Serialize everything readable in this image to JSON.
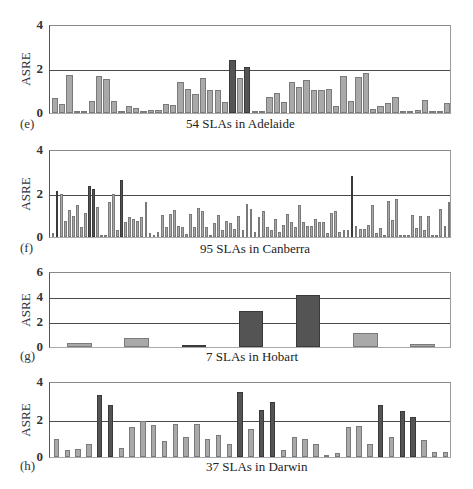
{
  "figure": {
    "y_axis_label": "ASRE"
  },
  "panels": [
    {
      "id": "e",
      "label": "(e)",
      "caption": "54 SLAs in Adelaide",
      "ymax": 4,
      "ticks": [
        "0",
        "2",
        "4"
      ],
      "gridlines": [
        2
      ]
    },
    {
      "id": "f",
      "label": "(f)",
      "caption": "95 SLAs in Canberra",
      "ymax": 4,
      "ticks": [
        "0",
        "2",
        "4"
      ],
      "gridlines": [
        2
      ]
    },
    {
      "id": "g",
      "label": "(g)",
      "caption": "7 SLAs in Hobart",
      "ymax": 6,
      "ticks": [
        "0",
        "2",
        "4",
        "6"
      ],
      "gridlines": [
        2,
        4
      ]
    },
    {
      "id": "h",
      "label": "(h)",
      "caption": "37 SLAs in Darwin",
      "ymax": 4,
      "ticks": [
        "0",
        "2",
        "4"
      ],
      "gridlines": [
        2
      ]
    }
  ],
  "colors": {
    "light_bar": "#a9a9a9",
    "dark_bar": "#545454",
    "gridline": "#4a4a4a"
  },
  "chart_data": [
    {
      "type": "bar",
      "title": "54 SLAs in Adelaide",
      "panel": "(e)",
      "xlabel": "54 SLAs in Adelaide",
      "ylabel": "ASRE",
      "ylim": [
        0,
        4
      ],
      "yticks": [
        0,
        2,
        4
      ],
      "grid": "horizontal at 2",
      "values": [
        0.7,
        0.4,
        1.75,
        0.02,
        0.02,
        0.55,
        1.7,
        1.55,
        0.55,
        0.0,
        0.3,
        0.25,
        0.05,
        0.15,
        0.15,
        0.4,
        0.35,
        1.4,
        1.1,
        0.85,
        1.6,
        1.05,
        1.05,
        0.5,
        2.4,
        1.6,
        2.1,
        0.0,
        0.05,
        0.75,
        0.9,
        0.5,
        1.4,
        1.2,
        1.5,
        1.05,
        1.05,
        1.1,
        0.3,
        1.7,
        0.55,
        1.65,
        1.8,
        0.2,
        0.3,
        0.45,
        0.75,
        0.02,
        0.02,
        0.15,
        0.6,
        0.02,
        0.1,
        0.45
      ],
      "highlight_indices": [
        24,
        26
      ]
    },
    {
      "type": "bar",
      "title": "95 SLAs in Canberra",
      "panel": "(f)",
      "xlabel": "95 SLAs in Canberra",
      "ylabel": "ASRE",
      "ylim": [
        0,
        4
      ],
      "yticks": [
        0,
        2,
        4
      ],
      "grid": "horizontal at 2",
      "values": [
        0.2,
        2.1,
        2.0,
        0.75,
        1.25,
        0.95,
        1.45,
        0.45,
        1.1,
        2.35,
        2.2,
        1.4,
        0.0,
        0.0,
        1.6,
        2.0,
        0.3,
        2.6,
        0.7,
        0.9,
        0.85,
        0.75,
        0.9,
        1.6,
        0.2,
        0.0,
        0.25,
        1.0,
        0.45,
        1.05,
        1.25,
        0.5,
        0.45,
        0.15,
        1.05,
        0.45,
        1.35,
        1.2,
        0.45,
        0.1,
        0.65,
        1.0,
        0.3,
        0.75,
        0.65,
        0.35,
        0.95,
        0.3,
        1.5,
        1.3,
        0.25,
        0.9,
        1.2,
        0.45,
        0.3,
        0.85,
        0.25,
        0.55,
        1.05,
        0.7,
        0.45,
        1.45,
        0.7,
        0.5,
        0.5,
        0.85,
        0.7,
        0.7,
        0.2,
        1.1,
        1.2,
        0.25,
        0.3,
        0.3,
        2.8,
        0.5,
        0.35,
        0.35,
        0.55,
        1.45,
        0.2,
        0.4,
        0.0,
        1.65,
        0.8,
        1.75,
        0.1,
        0.0,
        0.0,
        1.0,
        0.4,
        0.95,
        0.3,
        0.95,
        0.1,
        0.05,
        1.3,
        0.5,
        1.6
      ],
      "highlight_indices": [
        1,
        9,
        10,
        17,
        74
      ]
    },
    {
      "type": "bar",
      "title": "7 SLAs in Hobart",
      "panel": "(g)",
      "xlabel": "7 SLAs in Hobart",
      "ylabel": "ASRE",
      "ylim": [
        0,
        6
      ],
      "yticks": [
        0,
        2,
        4,
        6
      ],
      "grid": "horizontal at 2 and 4",
      "values": [
        0.35,
        0.7,
        0.15,
        2.9,
        4.2,
        1.15,
        0.25
      ],
      "highlight_indices": [
        2,
        3,
        4
      ]
    },
    {
      "type": "bar",
      "title": "37 SLAs in Darwin",
      "panel": "(h)",
      "xlabel": "37 SLAs in Darwin",
      "ylabel": "ASRE",
      "ylim": [
        0,
        4
      ],
      "yticks": [
        0,
        2,
        4
      ],
      "grid": "horizontal at 2",
      "values": [
        0.95,
        0.35,
        0.45,
        0.7,
        3.3,
        2.75,
        0.5,
        1.6,
        1.9,
        1.7,
        0.85,
        1.75,
        1.05,
        1.75,
        0.95,
        1.2,
        0.7,
        3.45,
        1.5,
        2.5,
        2.95,
        0.4,
        1.05,
        0.95,
        0.7,
        0.05,
        0.2,
        1.6,
        1.65,
        0.7,
        2.8,
        1.05,
        2.45,
        2.15,
        0.9,
        0.25,
        0.25
      ],
      "highlight_indices": [
        4,
        5,
        17,
        19,
        20,
        30,
        32,
        33
      ]
    }
  ]
}
